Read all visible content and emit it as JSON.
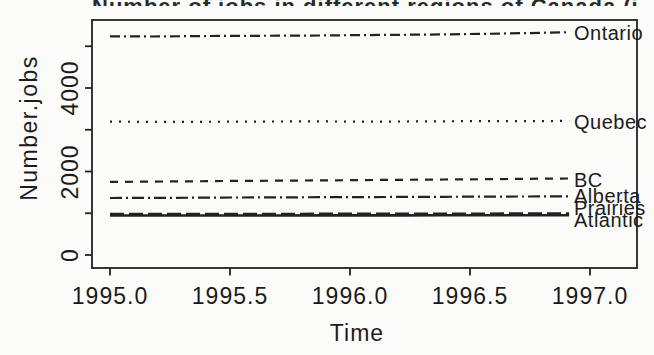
{
  "figure": {
    "title_cropped": "Number of jobs in different regions of Canada (in 1000s)"
  },
  "chart_data": {
    "type": "line",
    "title": "Number of jobs in different regions of Canada (in 1000s)",
    "title_note": "title is cropped at top edge of image; only letter bottoms visible",
    "xlabel": "Time",
    "ylabel": "Number.jobs",
    "grid": false,
    "legend_position": "labels-at-right-line-ends",
    "xlim": [
      1994.92,
      1997.2
    ],
    "ylim": [
      -310,
      5630
    ],
    "x_ticks": {
      "values": [
        1995.0,
        1995.5,
        1996.0,
        1996.5,
        1997.0
      ],
      "labels": [
        "1995.0",
        "1995.5",
        "1996.0",
        "1996.5",
        "1997.0"
      ]
    },
    "y_ticks": {
      "values": [
        0,
        1000,
        2000,
        3000,
        4000,
        5000
      ],
      "labels": [
        "0",
        "",
        "2000",
        "",
        "4000",
        ""
      ]
    },
    "x": [
      1995.0,
      1995.174,
      1995.348,
      1995.522,
      1995.696,
      1995.87,
      1996.043,
      1996.217,
      1996.391,
      1996.565,
      1996.739,
      1996.913
    ],
    "series": [
      {
        "name": "Ontario",
        "linetype": "dotdash",
        "values": [
          5239,
          5233,
          5244,
          5249,
          5253,
          5258,
          5267,
          5275,
          5285,
          5298,
          5316,
          5336
        ]
      },
      {
        "name": "Quebec",
        "linetype": "dotted",
        "values": [
          3196,
          3188,
          3191,
          3194,
          3197,
          3200,
          3196,
          3198,
          3203,
          3206,
          3205,
          3211
        ]
      },
      {
        "name": "BC",
        "linetype": "dashed",
        "values": [
          1752,
          1757,
          1766,
          1774,
          1780,
          1787,
          1794,
          1800,
          1808,
          1815,
          1824,
          1832
        ]
      },
      {
        "name": "Alberta",
        "linetype": "dotdash2",
        "values": [
          1366,
          1368,
          1372,
          1377,
          1380,
          1384,
          1387,
          1391,
          1395,
          1399,
          1402,
          1405
        ]
      },
      {
        "name": "Prairies",
        "linetype": "longdash",
        "values": [
          982,
          981,
          982,
          984,
          985,
          986,
          987,
          988,
          990,
          991,
          993,
          995
        ]
      },
      {
        "name": "Atlantic",
        "linetype": "solid",
        "values": [
          947,
          946,
          945,
          946,
          947,
          948,
          948,
          949,
          950,
          950,
          951,
          952
        ]
      }
    ],
    "colors": {
      "line": "#222222",
      "text": "#1b1b1b",
      "background": "#fbfbf9"
    }
  }
}
